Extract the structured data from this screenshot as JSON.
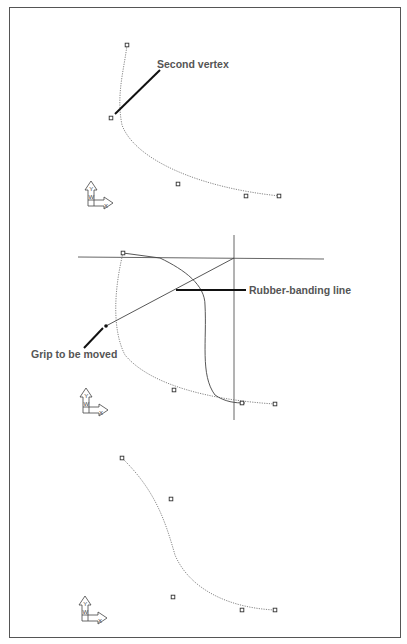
{
  "panels": [
    {
      "id": "panel-1",
      "callouts": [
        {
          "text": "Second vertex"
        }
      ],
      "ucs_icon": {
        "y_label": "Y",
        "w_label": "W",
        "x_label": "X"
      }
    },
    {
      "id": "panel-2",
      "callouts": [
        {
          "text": "Rubber-banding line"
        },
        {
          "text": "Grip to be moved"
        }
      ],
      "ucs_icon": {
        "y_label": "Y",
        "w_label": "W",
        "x_label": "X"
      }
    },
    {
      "id": "panel-3",
      "callouts": [],
      "ucs_icon": {
        "y_label": "Y",
        "w_label": "W",
        "x_label": "X"
      }
    }
  ],
  "colors": {
    "line": "#444444",
    "dotted_curve": "#777777",
    "text": "#555555",
    "frame": "#555555"
  }
}
